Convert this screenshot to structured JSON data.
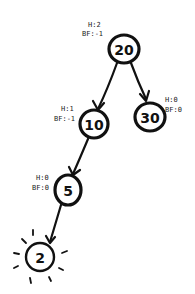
{
  "diagram": {
    "type": "avl-tree",
    "nodes": [
      {
        "id": "n20",
        "value": "20",
        "height_label": "H:2",
        "bf_label": "BF:-1"
      },
      {
        "id": "n10",
        "value": "10",
        "height_label": "H:1",
        "bf_label": "BF:-1"
      },
      {
        "id": "n30",
        "value": "30",
        "height_label": "H:0",
        "bf_label": "BF:0"
      },
      {
        "id": "n5",
        "value": "5",
        "height_label": "H:0",
        "bf_label": "BF:0"
      },
      {
        "id": "n2",
        "value": "2",
        "highlighted": true
      }
    ],
    "edges": [
      {
        "from": "20",
        "to": "10"
      },
      {
        "from": "20",
        "to": "30"
      },
      {
        "from": "10",
        "to": "5"
      },
      {
        "from": "5",
        "to": "2"
      }
    ],
    "colors": {
      "ink": "#111111",
      "background": "#ffffff"
    }
  }
}
